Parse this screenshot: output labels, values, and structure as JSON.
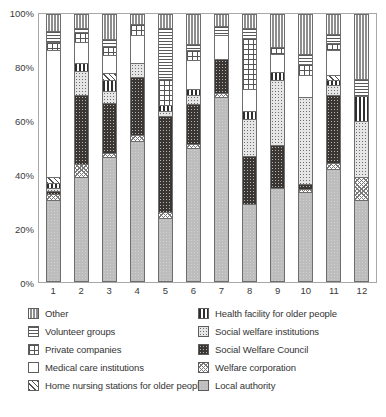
{
  "chart_data": {
    "type": "bar",
    "subtype": "stacked-percentage-column",
    "title": "",
    "xlabel": "",
    "ylabel": "",
    "ylim": [
      0,
      100
    ],
    "ytick_labels": [
      "100%",
      "80%",
      "60%",
      "40%",
      "20%",
      "0%"
    ],
    "ytick_values": [
      100,
      80,
      60,
      40,
      20,
      0
    ],
    "grid": false,
    "legend_position": "bottom",
    "categories": [
      "1",
      "2",
      "3",
      "4",
      "5",
      "6",
      "7",
      "8",
      "9",
      "10",
      "11",
      "12"
    ],
    "stack_order_bottom_to_top": [
      "Local authority",
      "Welfare corporation",
      "Social Welfare Council",
      "Social welfare institutions",
      "Health facility for older people",
      "Home nursing stations for older people",
      "Medical care institutions",
      "Private companies",
      "Volunteer groups",
      "Other"
    ],
    "series": [
      {
        "name": "Local authority",
        "key": "localauth",
        "values": [
          30.5,
          39.0,
          46.5,
          52.5,
          23.5,
          50.0,
          69.0,
          29.0,
          35.0,
          33.5,
          42.0,
          30.5
        ]
      },
      {
        "name": "Welfare corporation",
        "key": "welfarecorp",
        "values": [
          2.0,
          5.0,
          1.5,
          2.5,
          2.5,
          1.5,
          1.5,
          0.0,
          0.0,
          1.0,
          2.5,
          8.5
        ]
      },
      {
        "name": "Social Welfare Council",
        "key": "socwelcouncil",
        "values": [
          1.5,
          26.0,
          19.0,
          21.5,
          36.0,
          15.0,
          13.0,
          18.0,
          16.0,
          2.0,
          25.5,
          0.0
        ]
      },
      {
        "name": "Social welfare institutions",
        "key": "socwelinst",
        "values": [
          1.0,
          9.0,
          4.5,
          5.5,
          2.0,
          3.5,
          0.0,
          14.0,
          24.5,
          32.5,
          3.5,
          21.0
        ]
      },
      {
        "name": "Health facility for older people",
        "key": "healthfac",
        "values": [
          2.0,
          3.0,
          4.0,
          0.0,
          2.0,
          2.0,
          0.0,
          3.0,
          3.0,
          0.0,
          2.0,
          9.5
        ]
      },
      {
        "name": "Home nursing stations for older people",
        "key": "homenursing",
        "values": [
          2.0,
          0.0,
          2.5,
          0.0,
          0.0,
          0.0,
          0.0,
          0.0,
          0.0,
          0.0,
          2.0,
          0.0
        ]
      },
      {
        "name": "Medical care institutions",
        "key": "medical",
        "values": [
          48.0,
          8.0,
          7.0,
          10.5,
          0.0,
          11.0,
          9.0,
          8.0,
          7.0,
          8.5,
          9.5,
          0.0
        ]
      },
      {
        "name": "Private companies",
        "key": "private",
        "values": [
          3.0,
          3.5,
          3.5,
          4.0,
          10.0,
          4.0,
          0.0,
          19.5,
          2.5,
          4.0,
          2.5,
          0.0
        ]
      },
      {
        "name": "Volunteer groups",
        "key": "volunteer",
        "values": [
          4.0,
          1.5,
          2.5,
          0.0,
          19.0,
          2.0,
          3.5,
          3.5,
          0.0,
          4.0,
          3.5,
          6.5
        ]
      },
      {
        "name": "Other",
        "key": "other",
        "values": [
          6.0,
          5.0,
          9.0,
          3.5,
          5.0,
          11.0,
          4.0,
          5.0,
          12.0,
          14.5,
          7.0,
          24.0
        ]
      }
    ]
  },
  "axis": {
    "y_ticks": [
      "100%",
      "80%",
      "60%",
      "40%",
      "20%",
      "0%"
    ],
    "x_ticks": [
      "1",
      "2",
      "3",
      "4",
      "5",
      "6",
      "7",
      "8",
      "9",
      "10",
      "11",
      "12"
    ]
  },
  "legend": {
    "left_column": [
      {
        "label": "Other",
        "pattern": "other"
      },
      {
        "label": "Volunteer groups",
        "pattern": "volunteer"
      },
      {
        "label": "Private companies",
        "pattern": "private"
      },
      {
        "label": "Medical care institutions",
        "pattern": "medical"
      },
      {
        "label": "Home nursing stations for older people",
        "pattern": "homenursing"
      }
    ],
    "right_column": [
      {
        "label": "Health facility for older people",
        "pattern": "healthfac"
      },
      {
        "label": "Social welfare institutions",
        "pattern": "socwelinst"
      },
      {
        "label": "Social Welfare Council",
        "pattern": "socwelcouncil"
      },
      {
        "label": "Welfare corporation",
        "pattern": "welfarecorp"
      },
      {
        "label": "Local authority",
        "pattern": "localauth"
      }
    ]
  },
  "colors": {
    "axis_line": "#a8a8a8",
    "bar_outline": "#6e6e6e",
    "text": "#343434",
    "local_authority": "#bdbdbd",
    "social_welfare_council": "#3a3634",
    "background": "#ffffff"
  }
}
